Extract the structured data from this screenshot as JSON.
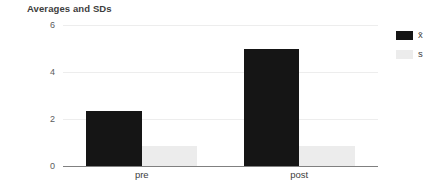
{
  "chart_data": {
    "type": "bar",
    "title": "Averages and SDs",
    "xlabel": "",
    "ylabel": "",
    "categories": [
      "pre",
      "post"
    ],
    "series": [
      {
        "name": "x̄",
        "values": [
          2.35,
          5.0
        ],
        "color": "#151515"
      },
      {
        "name": "s",
        "values": [
          0.85,
          0.85
        ],
        "color": "#ececec"
      }
    ],
    "ylim": [
      0,
      6
    ],
    "yticks": [
      0,
      2,
      4,
      6
    ],
    "ytick_labels": [
      "0",
      "2",
      "4",
      "6"
    ],
    "grid": true,
    "legend_position": "right",
    "grouped": true,
    "bar_gap_within_group": 0
  },
  "colors": {
    "background": "#ffffff",
    "gridline": "#ededed",
    "axis": "#808080",
    "title_text": "#3d3d3d",
    "tick_text": "#5c5c5c"
  }
}
